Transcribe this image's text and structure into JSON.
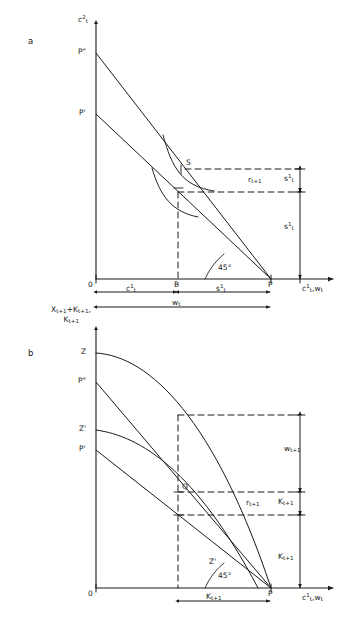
{
  "figure": {
    "type": "diagram",
    "background_color": "#ffffff",
    "line_color": "#1a1a1a"
  },
  "panel_a": {
    "letter": "a",
    "y_axis_label_main": "c",
    "y_axis_label_sup": "2",
    "y_axis_label_sub": "t",
    "x_axis_label": "c¹_t , w_t",
    "origin_label": "0",
    "angle_label": "45°",
    "y_intercepts": [
      {
        "name": "p-double-prime",
        "label": "P\""
      },
      {
        "name": "p-prime",
        "label": "P'"
      }
    ],
    "points": [
      {
        "name": "point-s",
        "label": "S"
      },
      {
        "name": "point-b",
        "label": "B"
      },
      {
        "name": "point-p",
        "label": "P"
      }
    ],
    "measures": [
      {
        "name": "interest-rate",
        "label": "r",
        "sub": "t+1"
      },
      {
        "name": "saving-upper",
        "label": "s",
        "sup": "1",
        "sub": "t"
      },
      {
        "name": "saving-lower",
        "label": "s",
        "sup": "1",
        "sub": "t"
      }
    ],
    "x_spans": [
      {
        "name": "consumption-span",
        "label": "c",
        "sup": "1",
        "sub": "t"
      },
      {
        "name": "saving-span",
        "label": "s",
        "sup": "1",
        "sub": "t"
      },
      {
        "name": "wage-span",
        "label": "w",
        "sub": "t"
      }
    ]
  },
  "panel_b": {
    "letter": "b",
    "y_axis_label_line1": "X_{t+1}+K_{t+1},",
    "y_axis_label_line2": "K_{t+1}",
    "x_axis_label": "c¹_t , w_t",
    "origin_label": "0",
    "angle_label": "45°",
    "y_intercepts": [
      {
        "name": "point-z",
        "label": "Z"
      },
      {
        "name": "p-double-prime",
        "label": "P\""
      },
      {
        "name": "point-z-prime",
        "label": "Z'"
      },
      {
        "name": "p-prime",
        "label": "P'"
      }
    ],
    "points": [
      {
        "name": "point-q",
        "label": "Q"
      },
      {
        "name": "point-z-prime-inner",
        "label": "Z'"
      },
      {
        "name": "point-p",
        "label": "P"
      }
    ],
    "measures": [
      {
        "name": "wage-next",
        "label": "w",
        "sub": "t+1"
      },
      {
        "name": "interest-rate",
        "label": "r",
        "sub": "t+1"
      },
      {
        "name": "capital-upper",
        "label": "K",
        "sub": "t+1"
      },
      {
        "name": "capital-lower",
        "label": "K",
        "sub": "t+1"
      }
    ],
    "x_spans": [
      {
        "name": "capital-span",
        "label": "K",
        "sub": "t+1"
      }
    ]
  }
}
